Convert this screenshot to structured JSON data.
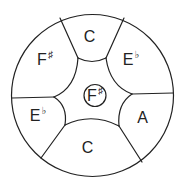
{
  "diagram": {
    "type": "steelpan-note-layout",
    "stroke_color": "#222222",
    "background": "#ffffff",
    "outer": {
      "cx": 92.5,
      "cy": 95.5,
      "r": 81
    },
    "center_note": {
      "cx": 95,
      "cy": 95.5,
      "r": 11
    },
    "notes": [
      {
        "id": "top-c",
        "name": "C",
        "accidental": "",
        "x": 90,
        "y": 37
      },
      {
        "id": "right-eb",
        "name": "E",
        "accidental": "♭",
        "x": 131,
        "y": 60
      },
      {
        "id": "right-a",
        "name": "A",
        "accidental": "",
        "x": 143,
        "y": 118
      },
      {
        "id": "bottom-c",
        "name": "C",
        "accidental": "",
        "x": 88,
        "y": 148
      },
      {
        "id": "left-eb",
        "name": "E",
        "accidental": "♭",
        "x": 38,
        "y": 116
      },
      {
        "id": "left-fsharp",
        "name": "F",
        "accidental": "♯",
        "x": 45,
        "y": 60
      },
      {
        "id": "center-fsharp",
        "name": "F",
        "accidental": "♯",
        "x": 95,
        "y": 96
      }
    ]
  }
}
